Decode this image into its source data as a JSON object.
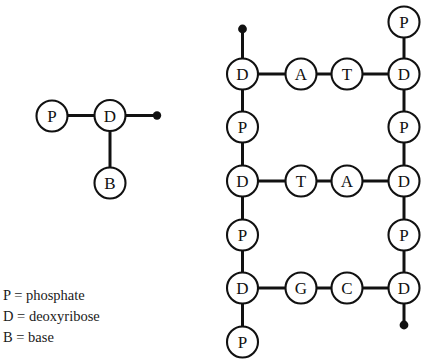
{
  "figure": {
    "background_color": "#ffffff",
    "stroke_color": "#111111"
  },
  "nucleotide_inset": {
    "name": "single-nucleotide-diagram",
    "nodes": {
      "phosphate": "P",
      "deoxyribose": "D",
      "base": "B"
    }
  },
  "dna_ladder": {
    "name": "dna-ladder-diagram",
    "left_backbone": [
      "D",
      "P",
      "D",
      "P",
      "D",
      "P"
    ],
    "right_backbone": [
      "P",
      "D",
      "P",
      "D",
      "P",
      "D"
    ],
    "base_pairs": [
      {
        "left": "A",
        "right": "T"
      },
      {
        "left": "T",
        "right": "A"
      },
      {
        "left": "G",
        "right": "C"
      }
    ]
  },
  "legend": {
    "name": "symbol-legend",
    "lines": [
      "P = phosphate",
      "D = deoxyribose",
      "B = base"
    ]
  }
}
